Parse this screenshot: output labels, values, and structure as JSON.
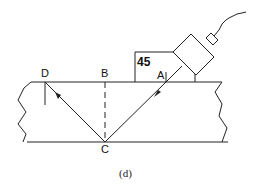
{
  "diagram": {
    "type": "ultrasonic angle-beam inspection schematic",
    "angle_label": "45",
    "points": {
      "A": "A",
      "B": "B",
      "C": "C",
      "D": "D"
    },
    "caption": "(d)",
    "colors": {
      "line": "#222222",
      "background": "#ffffff"
    }
  }
}
